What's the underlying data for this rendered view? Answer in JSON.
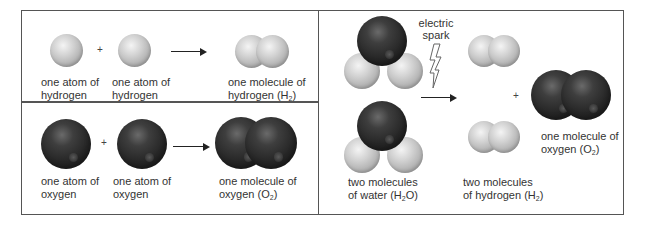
{
  "panels": {
    "hydrogen_reaction": {
      "reactant1_label": [
        "one atom of",
        "hydrogen"
      ],
      "reactant2_label": [
        "one atom of",
        "hydrogen"
      ],
      "plus": "+",
      "product_label": [
        "one molecule of",
        "hydrogen (H",
        "2",
        ")"
      ]
    },
    "oxygen_reaction": {
      "reactant1_label": [
        "one atom of",
        "oxygen"
      ],
      "reactant2_label": [
        "one atom of",
        "oxygen"
      ],
      "plus": "+",
      "product_label": [
        "one molecule of",
        "oxygen (O",
        "2",
        ")"
      ]
    },
    "electrolysis": {
      "condition_label": [
        "electric",
        "spark"
      ],
      "reactant_label": [
        "two molecules",
        "of water (H",
        "2",
        "O)"
      ],
      "product1_label": [
        "two molecules",
        "of hydrogen (H",
        "2",
        ")"
      ],
      "plus": "+",
      "product2_label": [
        "one molecule of",
        "oxygen (O",
        "2",
        ")"
      ]
    }
  },
  "colors": {
    "hydrogen": "#c8c8c8",
    "oxygen": "#2a2a2a",
    "border": "#555555"
  }
}
